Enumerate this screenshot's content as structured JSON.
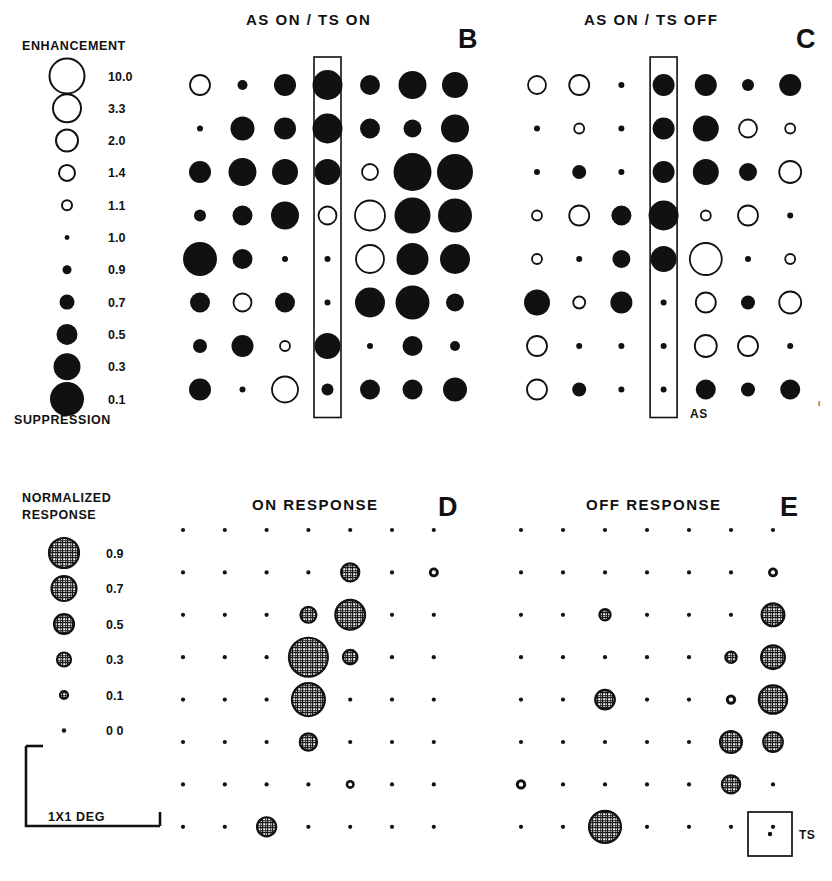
{
  "figure": {
    "background": "#ffffff",
    "ink": "#111111",
    "width": 832,
    "height": 881
  },
  "top_legend": {
    "header": "ENHANCEMENT",
    "footer": "SUPPRESSION",
    "values": [
      "10.0",
      "3.3",
      "2.0",
      "1.4",
      "1.1",
      "1.0",
      "0.9",
      "0.7",
      "0.5",
      "0.3",
      "0.1"
    ],
    "radii": [
      17.5,
      14.0,
      11.0,
      8.0,
      5.0,
      2.4,
      4.5,
      7.5,
      10.5,
      13.5,
      17.0
    ],
    "filled": [
      false,
      false,
      false,
      false,
      false,
      true,
      true,
      true,
      true,
      true,
      true
    ]
  },
  "bottom_legend": {
    "header_line1": "NORMALIZED",
    "header_line2": "RESPONSE",
    "values": [
      "0.9",
      "0.7",
      "0.5",
      "0.3",
      "0.1",
      "0 0"
    ],
    "radii": [
      15.0,
      12.5,
      10.0,
      7.0,
      4.0,
      2.2
    ]
  },
  "scale_bar": {
    "label": "1X1 DEG"
  },
  "ts_box": {
    "label": "TS"
  },
  "as_marker": {
    "label": "AS"
  },
  "panels": [
    {
      "id": "B",
      "letter": "B",
      "title": "AS  ON  /  TS  ON",
      "highlight_column": 3,
      "origin": {
        "x": 200,
        "y": 85
      },
      "col_step": 42.5,
      "row_step": 43.5,
      "rows": 8,
      "cols": 7
    },
    {
      "id": "C",
      "letter": "C",
      "title": "AS  ON  /  TS  OFF",
      "highlight_column": 3,
      "origin": {
        "x": 537,
        "y": 85
      },
      "col_step": 42.2,
      "row_step": 43.5,
      "rows": 8,
      "cols": 7
    },
    {
      "id": "D",
      "letter": "D",
      "title": "ON  RESPONSE",
      "highlight_column": -1,
      "origin": {
        "x": 183,
        "y": 530
      },
      "col_step": 41.8,
      "row_step": 42.4,
      "rows": 8,
      "cols": 7
    },
    {
      "id": "E",
      "letter": "E",
      "title": "OFF  RESPONSE",
      "highlight_column": -1,
      "origin": {
        "x": 521,
        "y": 530
      },
      "col_step": 42.0,
      "row_step": 42.4,
      "rows": 8,
      "cols": 7
    }
  ],
  "chart_data": {
    "type": "scatter",
    "encoding": {
      "marker": "circle whose radius encodes magnitude",
      "top_panels": "open circle = enhancement (>1.0), filled circle = suppression (<1.0); larger = stronger",
      "bottom_panels": "hatched circle area = normalized response 0.0-0.9"
    },
    "xlabel": "",
    "ylabel": "",
    "grid": false,
    "legend_position": "left",
    "panels": [
      {
        "id": "B",
        "title": "AS ON / TS ON",
        "quantity": "enhancement_suppression_ratio",
        "grid_rows": 8,
        "grid_cols": 7,
        "markers": [
          [
            {
              "r": 10,
              "f": false
            },
            {
              "r": 5,
              "f": true
            },
            {
              "r": 11,
              "f": true
            },
            {
              "r": 15,
              "f": true
            },
            {
              "r": 10,
              "f": true
            },
            {
              "r": 14,
              "f": true
            },
            {
              "r": 13,
              "f": true
            }
          ],
          [
            {
              "r": 3,
              "f": true
            },
            {
              "r": 12,
              "f": true
            },
            {
              "r": 11,
              "f": true
            },
            {
              "r": 15,
              "f": true
            },
            {
              "r": 10,
              "f": true
            },
            {
              "r": 9,
              "f": true
            },
            {
              "r": 14,
              "f": true
            }
          ],
          [
            {
              "r": 11,
              "f": true
            },
            {
              "r": 14,
              "f": true
            },
            {
              "r": 13,
              "f": true
            },
            {
              "r": 13,
              "f": true
            },
            {
              "r": 8,
              "f": false
            },
            {
              "r": 19,
              "f": true
            },
            {
              "r": 18,
              "f": true
            }
          ],
          [
            {
              "r": 6,
              "f": true
            },
            {
              "r": 10,
              "f": true
            },
            {
              "r": 14,
              "f": true
            },
            {
              "r": 9,
              "f": false
            },
            {
              "r": 15,
              "f": false
            },
            {
              "r": 18,
              "f": true
            },
            {
              "r": 17,
              "f": true
            }
          ],
          [
            {
              "r": 17,
              "f": true
            },
            {
              "r": 10,
              "f": true
            },
            {
              "r": 3,
              "f": true
            },
            {
              "r": 3,
              "f": true
            },
            {
              "r": 14,
              "f": false
            },
            {
              "r": 16,
              "f": true
            },
            {
              "r": 15,
              "f": true
            }
          ],
          [
            {
              "r": 10,
              "f": true
            },
            {
              "r": 9,
              "f": false
            },
            {
              "r": 10,
              "f": true
            },
            {
              "r": 3,
              "f": true
            },
            {
              "r": 15,
              "f": true
            },
            {
              "r": 17,
              "f": true
            },
            {
              "r": 9,
              "f": true
            }
          ],
          [
            {
              "r": 7,
              "f": true
            },
            {
              "r": 11,
              "f": true
            },
            {
              "r": 5,
              "f": false
            },
            {
              "r": 13,
              "f": true
            },
            {
              "r": 3,
              "f": true
            },
            {
              "r": 10,
              "f": true
            },
            {
              "r": 5,
              "f": true
            }
          ],
          [
            {
              "r": 11,
              "f": true
            },
            {
              "r": 3,
              "f": true
            },
            {
              "r": 13,
              "f": false
            },
            {
              "r": 6,
              "f": true
            },
            {
              "r": 10,
              "f": true
            },
            {
              "r": 10,
              "f": true
            },
            {
              "r": 12,
              "f": true
            }
          ]
        ]
      },
      {
        "id": "C",
        "title": "AS ON / TS OFF",
        "quantity": "enhancement_suppression_ratio",
        "grid_rows": 8,
        "grid_cols": 7,
        "markers": [
          [
            {
              "r": 9,
              "f": false
            },
            {
              "r": 10,
              "f": false
            },
            {
              "r": 3,
              "f": true
            },
            {
              "r": 11,
              "f": true
            },
            {
              "r": 11,
              "f": true
            },
            {
              "r": 6,
              "f": true
            },
            {
              "r": 11,
              "f": true
            }
          ],
          [
            {
              "r": 3,
              "f": true
            },
            {
              "r": 5,
              "f": false
            },
            {
              "r": 3,
              "f": true
            },
            {
              "r": 11,
              "f": true
            },
            {
              "r": 13,
              "f": true
            },
            {
              "r": 9,
              "f": false
            },
            {
              "r": 5,
              "f": false
            }
          ],
          [
            {
              "r": 3,
              "f": true
            },
            {
              "r": 7,
              "f": true
            },
            {
              "r": 3,
              "f": true
            },
            {
              "r": 11,
              "f": true
            },
            {
              "r": 13,
              "f": true
            },
            {
              "r": 9,
              "f": true
            },
            {
              "r": 11,
              "f": false
            }
          ],
          [
            {
              "r": 5,
              "f": false
            },
            {
              "r": 10,
              "f": false
            },
            {
              "r": 10,
              "f": true
            },
            {
              "r": 15,
              "f": true
            },
            {
              "r": 5,
              "f": false
            },
            {
              "r": 10,
              "f": false
            },
            {
              "r": 3,
              "f": true
            }
          ],
          [
            {
              "r": 5,
              "f": false
            },
            {
              "r": 3,
              "f": true
            },
            {
              "r": 9,
              "f": true
            },
            {
              "r": 13,
              "f": true
            },
            {
              "r": 16,
              "f": false
            },
            {
              "r": 3,
              "f": true
            },
            {
              "r": 5,
              "f": false
            }
          ],
          [
            {
              "r": 13,
              "f": true
            },
            {
              "r": 6,
              "f": false
            },
            {
              "r": 11,
              "f": true
            },
            {
              "r": 3,
              "f": true
            },
            {
              "r": 10,
              "f": false
            },
            {
              "r": 7,
              "f": true
            },
            {
              "r": 11,
              "f": false
            }
          ],
          [
            {
              "r": 10,
              "f": false
            },
            {
              "r": 3,
              "f": true
            },
            {
              "r": 3,
              "f": true
            },
            {
              "r": 3,
              "f": true
            },
            {
              "r": 11,
              "f": false
            },
            {
              "r": 10,
              "f": false
            },
            {
              "r": 3,
              "f": true
            }
          ],
          [
            {
              "r": 10,
              "f": false
            },
            {
              "r": 7,
              "f": true
            },
            {
              "r": 3,
              "f": true
            },
            {
              "r": 3,
              "f": true
            },
            {
              "r": 10,
              "f": true
            },
            {
              "r": 7,
              "f": true
            },
            {
              "r": 10,
              "f": true
            }
          ]
        ]
      },
      {
        "id": "D",
        "title": "ON RESPONSE",
        "quantity": "normalized_response",
        "grid_rows": 8,
        "grid_cols": 7,
        "values": [
          [
            0.0,
            0.0,
            0.0,
            0.0,
            0.0,
            0.0,
            0.0
          ],
          [
            0.0,
            0.0,
            0.0,
            0.0,
            0.3,
            0.0,
            0.12
          ],
          [
            0.0,
            0.0,
            0.0,
            0.25,
            0.55,
            0.0,
            0.0
          ],
          [
            0.0,
            0.0,
            0.0,
            0.75,
            0.22,
            0.0,
            0.0
          ],
          [
            0.0,
            0.0,
            0.0,
            0.62,
            0.0,
            0.0,
            0.0
          ],
          [
            0.0,
            0.0,
            0.0,
            0.28,
            0.0,
            0.0,
            0.0
          ],
          [
            0.0,
            0.0,
            0.0,
            0.0,
            0.1,
            0.0,
            0.0
          ],
          [
            0.0,
            0.0,
            0.32,
            0.0,
            0.0,
            0.0,
            0.0
          ]
        ]
      },
      {
        "id": "E",
        "title": "OFF RESPONSE",
        "quantity": "normalized_response",
        "grid_rows": 8,
        "grid_cols": 7,
        "values": [
          [
            0.0,
            0.0,
            0.0,
            0.0,
            0.0,
            0.0,
            0.0
          ],
          [
            0.0,
            0.0,
            0.0,
            0.0,
            0.0,
            0.0,
            0.12
          ],
          [
            0.0,
            0.0,
            0.15,
            0.0,
            0.0,
            0.0,
            0.4
          ],
          [
            0.0,
            0.0,
            0.0,
            0.0,
            0.0,
            0.15,
            0.42
          ],
          [
            0.0,
            0.0,
            0.33,
            0.0,
            0.0,
            0.13,
            0.52
          ],
          [
            0.0,
            0.0,
            0.0,
            0.0,
            0.0,
            0.38,
            0.33
          ],
          [
            0.13,
            0.0,
            0.0,
            0.0,
            0.0,
            0.3,
            0.0
          ],
          [
            0.0,
            0.0,
            0.6,
            0.0,
            0.0,
            0.0,
            0.0
          ]
        ]
      }
    ]
  }
}
